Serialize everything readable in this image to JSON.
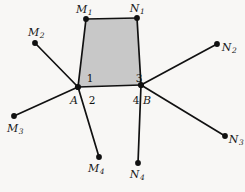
{
  "figure": {
    "background_color": "#f8f7f5",
    "stroke_color": "#111111",
    "fill_color": "#c8c8c8",
    "quad_fill_label": "shaded-quadrilateral"
  },
  "vertices": {
    "A": {
      "label": "A",
      "x": 78,
      "y": 87,
      "label_x": 74,
      "label_y": 100
    },
    "B": {
      "label": "B",
      "x": 141,
      "y": 85,
      "label_x": 147,
      "label_y": 100
    }
  },
  "points": [
    {
      "id": "M1",
      "base": "M",
      "sub": "1",
      "x": 86,
      "y": 19,
      "label_x": 84,
      "label_y": 9
    },
    {
      "id": "M2",
      "base": "M",
      "sub": "2",
      "x": 35,
      "y": 43,
      "label_x": 36,
      "label_y": 32
    },
    {
      "id": "M3",
      "base": "M",
      "sub": "3",
      "x": 14,
      "y": 116,
      "label_x": 15,
      "label_y": 128
    },
    {
      "id": "M4",
      "base": "M",
      "sub": "4",
      "x": 99,
      "y": 157,
      "label_x": 96,
      "label_y": 168
    },
    {
      "id": "N1",
      "base": "N",
      "sub": "1",
      "x": 137,
      "y": 18,
      "label_x": 137,
      "label_y": 8
    },
    {
      "id": "N2",
      "base": "N",
      "sub": "2",
      "x": 217,
      "y": 44,
      "label_x": 229,
      "label_y": 47
    },
    {
      "id": "N3",
      "base": "N",
      "sub": "3",
      "x": 225,
      "y": 136,
      "label_x": 236,
      "label_y": 139
    },
    {
      "id": "N4",
      "base": "N",
      "sub": "4",
      "x": 138,
      "y": 163,
      "label_x": 137,
      "label_y": 174
    }
  ],
  "angle_labels": [
    {
      "id": "angle-1",
      "text": "1",
      "x": 90,
      "y": 78
    },
    {
      "id": "angle-2",
      "text": "2",
      "x": 92,
      "y": 100
    },
    {
      "id": "angle-3",
      "text": "3",
      "x": 139,
      "y": 78
    },
    {
      "id": "angle-4",
      "text": "4",
      "x": 136,
      "y": 100
    }
  ],
  "edges": [
    {
      "id": "edge-A-M1",
      "from": "A",
      "to": "M1"
    },
    {
      "id": "edge-A-M2",
      "from": "A",
      "to": "M2"
    },
    {
      "id": "edge-A-M3",
      "from": "A",
      "to": "M3"
    },
    {
      "id": "edge-A-M4",
      "from": "A",
      "to": "M4"
    },
    {
      "id": "edge-B-N1",
      "from": "B",
      "to": "N1"
    },
    {
      "id": "edge-B-N2",
      "from": "B",
      "to": "N2"
    },
    {
      "id": "edge-B-N3",
      "from": "B",
      "to": "N3"
    },
    {
      "id": "edge-B-N4",
      "from": "B",
      "to": "N4"
    },
    {
      "id": "edge-A-B",
      "from": "A",
      "to": "B"
    },
    {
      "id": "edge-M1-N1",
      "from": "M1",
      "to": "N1"
    }
  ],
  "quad_path": "M 78 87 L 86 19 L 137 18 L 141 85 Z"
}
